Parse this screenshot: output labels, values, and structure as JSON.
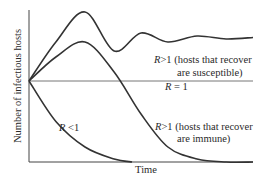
{
  "chart_data": {
    "type": "line",
    "title": "",
    "xlabel": "Time",
    "ylabel": "Number of infectious hosts",
    "grid": false,
    "legend": "none (curves labeled inline)",
    "line_color": "#333333",
    "axis_color": "#444444",
    "baseline_color": "#777777",
    "series": [
      {
        "name": "R>1 susceptible",
        "label_line1": "R>1  (hosts that recover",
        "label_line2": "are susceptible)",
        "behavior": "rises to a high peak then damped oscillation settling at an endemic level",
        "x": [
          0,
          0.12,
          0.25,
          0.38,
          0.5,
          0.62,
          0.75,
          0.88,
          1.0
        ],
        "y": [
          0.54,
          0.8,
          1.0,
          0.74,
          0.86,
          0.8,
          0.84,
          0.82,
          0.83
        ]
      },
      {
        "name": "R>1 immune",
        "label_line1": "R>1  (hosts that recover",
        "label_line2": "are immune)",
        "behavior": "rises to a peak then declines to near zero",
        "x": [
          0,
          0.12,
          0.25,
          0.38,
          0.5,
          0.62,
          0.75,
          0.88,
          1.0
        ],
        "y": [
          0.54,
          0.7,
          0.8,
          0.6,
          0.32,
          0.1,
          0.02,
          0.0,
          0.0
        ]
      },
      {
        "name": "R = 1",
        "label_line1": "R = 1",
        "behavior": "constant",
        "x": [
          0,
          1.0
        ],
        "y": [
          0.54,
          0.54
        ]
      },
      {
        "name": "R < 1",
        "label_line1": "R < 1",
        "behavior": "decays toward zero",
        "x": [
          0,
          0.12,
          0.25,
          0.38,
          0.46
        ],
        "y": [
          0.54,
          0.27,
          0.1,
          0.02,
          0.0
        ]
      }
    ],
    "xlim": [
      0,
      1
    ],
    "ylim": [
      0,
      1
    ]
  }
}
